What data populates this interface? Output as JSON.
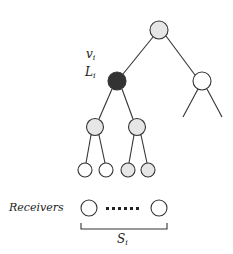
{
  "diagram": {
    "type": "tree",
    "labels": {
      "v": "v",
      "v_sub": "i",
      "L": "L",
      "L_sub": "i",
      "receivers": "Receivers",
      "S": "S",
      "S_sub": "i",
      "dots": "......"
    },
    "colors": {
      "line": "#333333",
      "gray_fill": "#e6e6e6",
      "white_fill": "#ffffff",
      "dark_fill": "#333333"
    },
    "nodes": [
      {
        "id": "root",
        "x": 159,
        "y": 30,
        "r": 9,
        "fill": "gray"
      },
      {
        "id": "vi",
        "x": 117,
        "y": 81,
        "r": 9,
        "fill": "dark"
      },
      {
        "id": "right",
        "x": 202,
        "y": 81,
        "r": 9,
        "fill": "white"
      },
      {
        "id": "l2a",
        "x": 95,
        "y": 127,
        "r": 9,
        "fill": "gray"
      },
      {
        "id": "l2b",
        "x": 137,
        "y": 127,
        "r": 9,
        "fill": "gray"
      },
      {
        "id": "l3a",
        "x": 85,
        "y": 170,
        "r": 7,
        "fill": "white"
      },
      {
        "id": "l3b",
        "x": 106,
        "y": 170,
        "r": 7,
        "fill": "white"
      },
      {
        "id": "l3c",
        "x": 128,
        "y": 170,
        "r": 7,
        "fill": "gray"
      },
      {
        "id": "l3d",
        "x": 148,
        "y": 170,
        "r": 7,
        "fill": "gray"
      },
      {
        "id": "recv1",
        "x": 89,
        "y": 208,
        "r": 8,
        "fill": "white"
      },
      {
        "id": "recv2",
        "x": 159,
        "y": 208,
        "r": 8,
        "fill": "white"
      }
    ]
  }
}
